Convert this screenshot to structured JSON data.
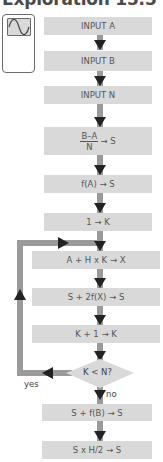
{
  "title": "Exploration 15.5",
  "calculator_icon": "graphing-calculator-icon",
  "steps": [
    {
      "text": "INPUT A"
    },
    {
      "text": "INPUT B"
    },
    {
      "text": "INPUT N"
    },
    {
      "numerator": "B–A",
      "denominator": "N",
      "rest": "→ S"
    },
    {
      "text": "f(A) → S"
    },
    {
      "text": "1 → K"
    },
    {
      "text": "A + H x K → X"
    },
    {
      "text": "S + 2f(X) → S"
    },
    {
      "text": "K + 1 → K"
    },
    {
      "text": "S + f(B) → S"
    },
    {
      "text": "S x H/2 → S"
    }
  ],
  "decision": {
    "text": "K < N?",
    "yes_label": "yes",
    "no_label": "no"
  },
  "colors": {
    "box": "#d9d9d9",
    "connector": "#9a9a9a",
    "arrowhead": "#222222",
    "text": "#555555"
  }
}
